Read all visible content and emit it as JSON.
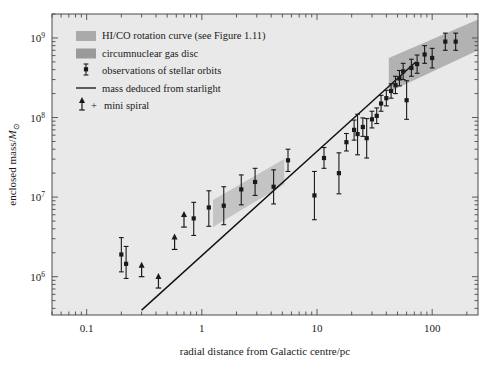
{
  "chart_data": {
    "type": "scatter",
    "title": "",
    "xlabel": "radial distance from Galactic centre/pc",
    "ylabel": "enclosed mass/M⊙",
    "xscale": "log",
    "yscale": "log",
    "xlim": [
      0.05,
      250
    ],
    "ylim": [
      330000,
      2000000000
    ],
    "grid": false,
    "legend_position": "upper-left-inside",
    "xticks": [
      "0.1",
      "1",
      "10",
      "100"
    ],
    "xtick_values": [
      0.1,
      1,
      10,
      100
    ],
    "yticks": [
      "10⁶",
      "10⁷",
      "10⁸",
      "10⁹"
    ],
    "ytick_values": [
      1000000,
      10000000,
      100000000,
      1000000000
    ],
    "series": [
      {
        "name": "observations of stellar orbits",
        "marker": "square-with-errorbars",
        "color": "#1a1a1a",
        "points": [
          {
            "x": 0.2,
            "y": 1900000,
            "ylow": 1150000,
            "yhigh": 3100000
          },
          {
            "x": 0.22,
            "y": 1450000,
            "ylow": 950000,
            "yhigh": 2400000
          },
          {
            "x": 0.85,
            "y": 5400000,
            "ylow": 3300000,
            "yhigh": 8600000
          },
          {
            "x": 1.15,
            "y": 7400000,
            "ylow": 4300000,
            "yhigh": 12000000
          },
          {
            "x": 1.55,
            "y": 7800000,
            "ylow": 4500000,
            "yhigh": 13500000
          },
          {
            "x": 2.2,
            "y": 12500000,
            "ylow": 8000000,
            "yhigh": 19000000
          },
          {
            "x": 2.9,
            "y": 15500000,
            "ylow": 10500000,
            "yhigh": 23000000
          },
          {
            "x": 4.2,
            "y": 13500000,
            "ylow": 8200000,
            "yhigh": 22000000
          },
          {
            "x": 5.6,
            "y": 29000000,
            "ylow": 21000000,
            "yhigh": 40000000
          },
          {
            "x": 9.5,
            "y": 10500000,
            "ylow": 5200000,
            "yhigh": 21000000
          },
          {
            "x": 11.5,
            "y": 31000000,
            "ylow": 23000000,
            "yhigh": 42000000
          },
          {
            "x": 15.5,
            "y": 20000000,
            "ylow": 11000000,
            "yhigh": 36000000
          },
          {
            "x": 18.0,
            "y": 49000000,
            "ylow": 38000000,
            "yhigh": 63000000
          },
          {
            "x": 21.0,
            "y": 70000000,
            "ylow": 52000000,
            "yhigh": 93000000
          },
          {
            "x": 22.5,
            "y": 62000000,
            "ylow": 34000000,
            "yhigh": 110000000
          },
          {
            "x": 25.0,
            "y": 76000000,
            "ylow": 58000000,
            "yhigh": 99000000
          },
          {
            "x": 27.0,
            "y": 55000000,
            "ylow": 31000000,
            "yhigh": 97000000
          },
          {
            "x": 30.0,
            "y": 95000000,
            "ylow": 74000000,
            "yhigh": 120000000
          },
          {
            "x": 33.0,
            "y": 105000000,
            "ylow": 84000000,
            "yhigh": 132000000
          },
          {
            "x": 36.0,
            "y": 150000000,
            "ylow": 120000000,
            "yhigh": 190000000
          },
          {
            "x": 40.0,
            "y": 175000000,
            "ylow": 140000000,
            "yhigh": 220000000
          },
          {
            "x": 44.0,
            "y": 215000000,
            "ylow": 175000000,
            "yhigh": 265000000
          },
          {
            "x": 48.0,
            "y": 255000000,
            "ylow": 200000000,
            "yhigh": 330000000
          },
          {
            "x": 52.0,
            "y": 310000000,
            "ylow": 250000000,
            "yhigh": 390000000
          },
          {
            "x": 56.0,
            "y": 380000000,
            "ylow": 300000000,
            "yhigh": 480000000
          },
          {
            "x": 60.0,
            "y": 165000000,
            "ylow": 95000000,
            "yhigh": 290000000
          },
          {
            "x": 66.0,
            "y": 420000000,
            "ylow": 330000000,
            "yhigh": 540000000
          },
          {
            "x": 74.0,
            "y": 470000000,
            "ylow": 360000000,
            "yhigh": 610000000
          },
          {
            "x": 86.0,
            "y": 620000000,
            "ylow": 480000000,
            "yhigh": 800000000
          },
          {
            "x": 100.0,
            "y": 560000000,
            "ylow": 420000000,
            "yhigh": 740000000
          },
          {
            "x": 130.0,
            "y": 900000000,
            "ylow": 700000000,
            "yhigh": 1150000000
          },
          {
            "x": 160.0,
            "y": 900000000,
            "ylow": 700000000,
            "yhigh": 1150000000
          }
        ]
      },
      {
        "name": "mini spiral",
        "marker": "upward-arrow-upper-limit",
        "color": "#1a1a1a",
        "points": [
          {
            "x": 0.3,
            "y": 1450000,
            "ylow": 1000000
          },
          {
            "x": 0.42,
            "y": 1050000,
            "ylow": 720000
          },
          {
            "x": 0.58,
            "y": 3300000,
            "ylow": 2200000
          },
          {
            "x": 0.7,
            "y": 6300000,
            "ylow": 4200000
          }
        ]
      }
    ],
    "line": {
      "name": "mass deduced from starlight",
      "color": "#111111",
      "x_start": 0.3,
      "y_start": 380000,
      "x_end": 72.0,
      "y_end": 500000000
    },
    "bands": [
      {
        "name": "HI/CO rotation curve (see Figure 1.11)",
        "color": "#a8a8a8",
        "x_start": 42.0,
        "x_end": 250.0,
        "y_low_start": 210000000,
        "y_high_start": 560000000,
        "y_low_end": 700000000,
        "y_high_end": 1700000000
      },
      {
        "name": "circumnuclear gas disc",
        "color": "#bdbdbd",
        "x_start": 1.25,
        "x_end": 5.2,
        "y_low_start": 4200000,
        "y_high_start": 9200000,
        "y_low_end": 14500000,
        "y_high_end": 30000000
      }
    ]
  },
  "legend": {
    "items": [
      {
        "label": "HI/CO rotation curve (see Figure 1.11)",
        "marker": "swatch",
        "color": "#aaaaaa"
      },
      {
        "label": "circumnuclear gas disc",
        "marker": "swatch",
        "color": "#9a9a9a"
      },
      {
        "label": "observations of stellar orbits",
        "marker": "point-errorbar",
        "color": "#1a1a1a"
      },
      {
        "label": "mass deduced from starlight",
        "marker": "line",
        "color": "#111111"
      },
      {
        "label": "mini spiral",
        "marker": "arrow-plus",
        "color": "#1a1a1a"
      }
    ]
  },
  "axes": {
    "x_title": "radial distance from Galactic centre/pc",
    "y_title_main": "enclosed mass/",
    "y_title_sym": "M",
    "y_title_sub": "⊙",
    "x_tick_labels": [
      "0.1",
      "1",
      "10",
      "100"
    ],
    "y_tick_mantissa": [
      "10",
      "10",
      "10",
      "10"
    ],
    "y_tick_exponents": [
      "6",
      "7",
      "8",
      "9"
    ]
  },
  "style": {
    "plot_background": "#e9e9e9",
    "page_background": "#ffffff",
    "axis_color": "#4a4a4a",
    "text_color": "#1a1a1a"
  }
}
